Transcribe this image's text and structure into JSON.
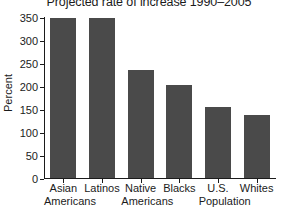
{
  "chart_data": {
    "type": "bar",
    "title": "Projected rate of increase 1990–2005",
    "xlabel": "",
    "ylabel": "Percent",
    "ylim": [
      0,
      350
    ],
    "yticks": [
      0,
      50,
      100,
      150,
      200,
      250,
      300,
      350
    ],
    "ytick_labels": [
      "0",
      "50",
      "100",
      "150",
      "200",
      "250",
      "300",
      "350"
    ],
    "grid": false,
    "legend": "none",
    "bar_color": "#4a4a4a",
    "axis_color": "#1b1b1b",
    "background": "#ffffff",
    "categories": [
      "Asian Americans",
      "Latinos",
      "Native Americans",
      "Blacks",
      "U.S. Population",
      "Whites"
    ],
    "category_lines": [
      {
        "line1": "Asian",
        "line2": "Americans"
      },
      {
        "line1": "Latinos",
        "line2": ""
      },
      {
        "line1": "Native",
        "line2": "Americans"
      },
      {
        "line1": "Blacks",
        "line2": ""
      },
      {
        "line1": "U.S.",
        "line2": "Population"
      },
      {
        "line1": "Whites",
        "line2": ""
      }
    ],
    "values": [
      350,
      350,
      237,
      204,
      156,
      139
    ],
    "bars": [
      {
        "label": "Asian Americans",
        "value": 350
      },
      {
        "label": "Latinos",
        "value": 350
      },
      {
        "label": "Native Americans",
        "value": 237
      },
      {
        "label": "Blacks",
        "value": 204
      },
      {
        "label": "U.S. Population",
        "value": 156
      },
      {
        "label": "Whites",
        "value": 139
      }
    ]
  }
}
